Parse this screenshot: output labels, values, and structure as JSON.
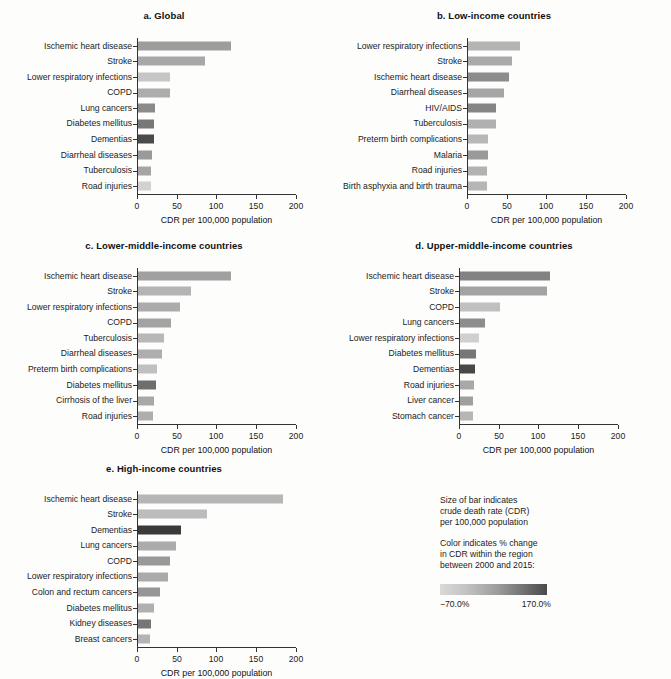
{
  "chart_data": {
    "type": "bar",
    "xlabel": "CDR per 100,000 population",
    "ylabel": "",
    "xlim": [
      0,
      200
    ],
    "xticks": [
      0,
      50,
      100,
      150,
      200
    ],
    "grid": false,
    "orientation": "horizontal",
    "legend": {
      "position": "bottom-right",
      "size_note_line1": "Size of bar indicates",
      "size_note_line2": "crude death rate (CDR)",
      "size_note_line3": "per 100,000 population",
      "color_note_line1": "Color indicates % change",
      "color_note_line2": "in CDR within the region",
      "color_note_line3": "between 2000 and 2015:",
      "scale_min_label": "−70.0%",
      "scale_max_label": "170.0%",
      "scale_min_color": "#d9d9d9",
      "scale_max_color": "#4a4a4a"
    },
    "panels": [
      {
        "id": "a",
        "title": "a. Global",
        "xlabel": "CDR per 100,000 population",
        "categories": [
          "Ischemic heart disease",
          "Stroke",
          "Lower respiratory infections",
          "COPD",
          "Lung cancers",
          "Diabetes mellitus",
          "Dementias",
          "Diarrheal diseases",
          "Tuberculosis",
          "Road injuries"
        ],
        "values": [
          118,
          85,
          42,
          41,
          23,
          22,
          21,
          19,
          18,
          18
        ],
        "colors": [
          "#9d9d9d",
          "#a8a8a8",
          "#c6c6c6",
          "#adadad",
          "#8b8b8b",
          "#787878",
          "#4b4b4b",
          "#9a9a9a",
          "#a5a5a5",
          "#d2d2d2"
        ]
      },
      {
        "id": "b",
        "title": "b. Low-income countries",
        "xlabel": "CDR per 100,000 population",
        "categories": [
          "Lower respiratory infections",
          "Stroke",
          "Ischemic heart disease",
          "Diarrheal diseases",
          "HIV/AIDS",
          "Tuberculosis",
          "Preterm birth complications",
          "Malaria",
          "Road injuries",
          "Birth asphyxia and birth trauma"
        ],
        "values": [
          67,
          57,
          53,
          46,
          37,
          36,
          27,
          26,
          25,
          25
        ],
        "colors": [
          "#b4b4b4",
          "#aaaaaa",
          "#8c8c8c",
          "#a6a6a6",
          "#858585",
          "#b0b0b0",
          "#b8b8b8",
          "#9a9a9a",
          "#b2b2b2",
          "#b6b6b6"
        ]
      },
      {
        "id": "c",
        "title": "c. Lower-middle-income countries",
        "xlabel": "CDR per 100,000 population",
        "categories": [
          "Ischemic heart disease",
          "Stroke",
          "Lower respiratory infections",
          "COPD",
          "Tuberculosis",
          "Diarrheal diseases",
          "Preterm birth complications",
          "Diabetes mellitus",
          "Cirrhosis of the liver",
          "Road injuries"
        ],
        "values": [
          118,
          68,
          54,
          43,
          34,
          32,
          25,
          24,
          21,
          20
        ],
        "colors": [
          "#a0a0a0",
          "#b4b4b4",
          "#ababab",
          "#a3a3a3",
          "#b8b8b8",
          "#aeaeae",
          "#c0c0c0",
          "#6e6e6e",
          "#a8a8a8",
          "#aeaeae"
        ]
      },
      {
        "id": "d",
        "title": "d. Upper-middle-income countries",
        "xlabel": "CDR per 100,000 population",
        "categories": [
          "Ischemic heart disease",
          "Stroke",
          "COPD",
          "Lung cancers",
          "Lower respiratory infections",
          "Diabetes mellitus",
          "Dementias",
          "Road injuries",
          "Liver cancer",
          "Stomach cancer"
        ],
        "values": [
          114,
          111,
          52,
          33,
          25,
          22,
          20,
          19,
          18,
          17
        ],
        "colors": [
          "#828282",
          "#a3a3a3",
          "#c0c0c0",
          "#8d8d8d",
          "#cfcfcf",
          "#777777",
          "#484848",
          "#a9a9a9",
          "#a0a0a0",
          "#b6b6b6"
        ]
      },
      {
        "id": "e",
        "title": "e. High-income countries",
        "xlabel": "CDR per 100,000 population",
        "categories": [
          "Ischemic heart disease",
          "Stroke",
          "Dementias",
          "Lung cancers",
          "COPD",
          "Lower respiratory infections",
          "Colon and rectum cancers",
          "Diabetes mellitus",
          "Kidney diseases",
          "Breast cancers"
        ],
        "values": [
          184,
          88,
          55,
          49,
          41,
          39,
          29,
          21,
          17,
          16
        ],
        "colors": [
          "#b6b6b6",
          "#bcbcbc",
          "#3a3a3a",
          "#ababab",
          "#999999",
          "#aaaaaa",
          "#969696",
          "#b0b0b0",
          "#767676",
          "#b4b4b4"
        ]
      }
    ]
  }
}
